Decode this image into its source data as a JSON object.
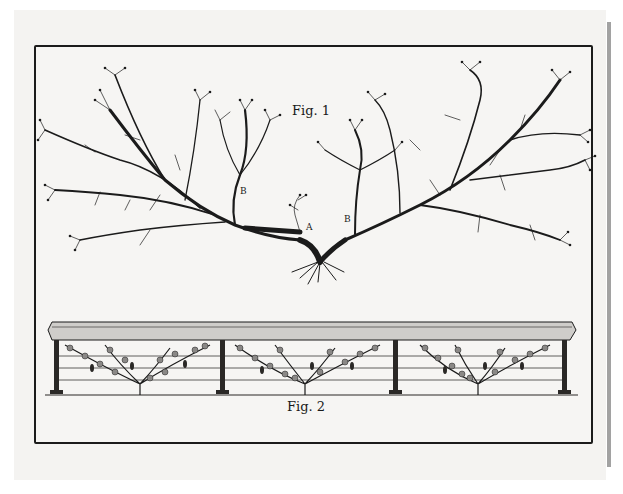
{
  "plate": {
    "description": "Engraved plate showing vine training: a pruned vine branching structure and a trellis with espaliered vines",
    "figures": [
      {
        "id": "fig1",
        "label": "Fig. 1",
        "subject": "vine stock with two main arms spreading left and right",
        "markers": [
          {
            "letter": "A",
            "meaning": "cut stub at center"
          },
          {
            "letter": "B",
            "position": "left arm"
          },
          {
            "letter": "B",
            "position": "right arm"
          }
        ]
      },
      {
        "id": "fig2",
        "label": "Fig. 2",
        "subject": "covered trellis with three espaliered vines on horizontal wires",
        "posts": 4,
        "wires": 3,
        "vines": 3
      }
    ]
  },
  "colors": {
    "paper": "#f6f5f3",
    "ink": "#1b1b1b",
    "border": "#1b1b1b"
  }
}
